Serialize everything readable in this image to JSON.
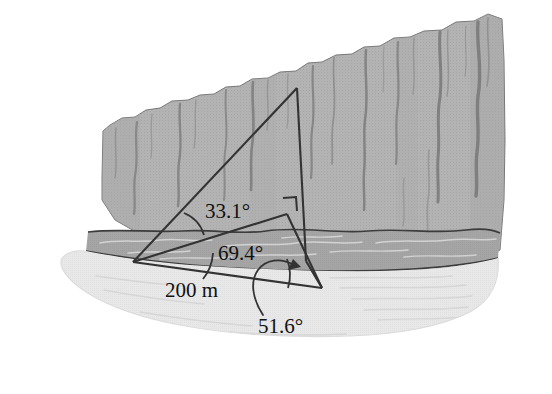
{
  "labels": {
    "angle_top": "33.1°",
    "angle_middle": "69.4°",
    "baseline": "200 m",
    "angle_bottom": "51.6°"
  },
  "colors": {
    "cliff_face": "#b0b0b0",
    "cliff_face_light": "#bcbcbc",
    "water": "#a3a3a3",
    "sand": "#e7e7e7",
    "sand_shadow": "#dedede",
    "line": "#3a3a3a",
    "crack": "#8a8a8a",
    "text": "#111111",
    "background": "#ffffff"
  },
  "geometry": {
    "vertex_left": [
      133,
      262
    ],
    "vertex_apex": [
      297,
      88
    ],
    "vertex_right": [
      322,
      288
    ],
    "vertex_cliff_base": [
      287,
      214
    ],
    "right_angle_corner": [
      287,
      214
    ]
  },
  "icons": {
    "arrowhead": "arrowhead-icon",
    "right_angle": "right-angle-mark-icon",
    "leader_curve": "leader-curve-icon"
  }
}
